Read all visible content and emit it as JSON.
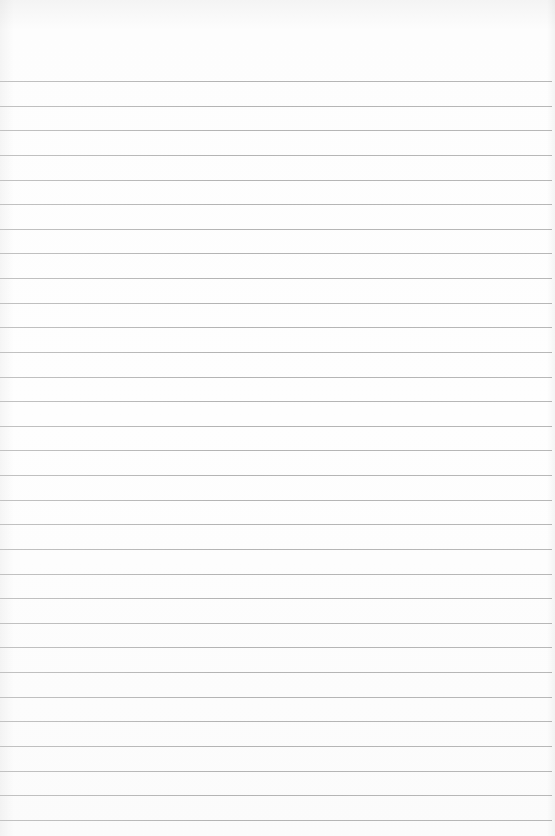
{
  "paper": {
    "type": "lined notebook paper",
    "background_color": "#fbfbfb",
    "rule_color": "#b6b6b6",
    "rule_count": 31,
    "first_rule_y": 81,
    "rule_spacing": 24.63,
    "rule_width": 552
  }
}
